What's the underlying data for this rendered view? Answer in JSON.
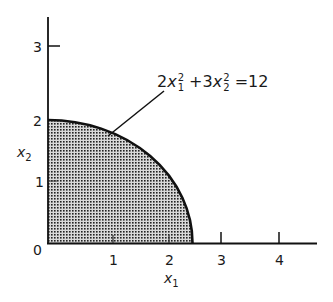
{
  "diagram": {
    "equation": {
      "coef1": "2",
      "var1": "x",
      "sub1": "1",
      "sup1": "2",
      "plus": " +3",
      "var2": "x",
      "sub2": "2",
      "sup2": "2",
      "rhs": " =12"
    },
    "x_axis": {
      "label_var": "x",
      "label_sub": "1",
      "ticks": [
        "0",
        "1",
        "2",
        "3",
        "4"
      ]
    },
    "y_axis": {
      "label_var": "x",
      "label_sub": "2",
      "ticks": [
        "1",
        "2",
        "3"
      ]
    },
    "region": {
      "description": "Shaded first-quadrant region under ellipse 2x1^2 + 3x2^2 = 12",
      "x_intercept": 2.449,
      "y_intercept": 2,
      "fill_pattern": "crosshatch",
      "stroke_color": "#111111"
    }
  }
}
